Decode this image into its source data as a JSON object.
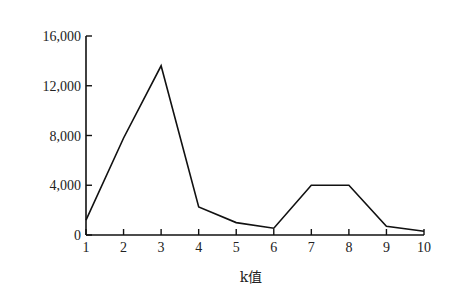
{
  "chart_data": {
    "type": "line",
    "title": "",
    "xlabel": "k值",
    "ylabel": "",
    "x": [
      1,
      2,
      3,
      4,
      5,
      6,
      7,
      8,
      9,
      10
    ],
    "categories": [
      "1",
      "2",
      "3",
      "4",
      "5",
      "6",
      "7",
      "8",
      "9",
      "10"
    ],
    "series": [
      {
        "name": "",
        "values": [
          1200,
          7800,
          13600,
          2250,
          1000,
          550,
          4000,
          4000,
          700,
          300
        ]
      }
    ],
    "yticks": [
      0,
      4000,
      8000,
      12000,
      16000
    ],
    "ytick_labels": [
      "0",
      "4,000",
      "8,000",
      "12,000",
      "16,000"
    ],
    "ylim": [
      0,
      16000
    ],
    "xlim": [
      1,
      10
    ],
    "grid": false,
    "legend": null,
    "line_color": "#111111"
  }
}
